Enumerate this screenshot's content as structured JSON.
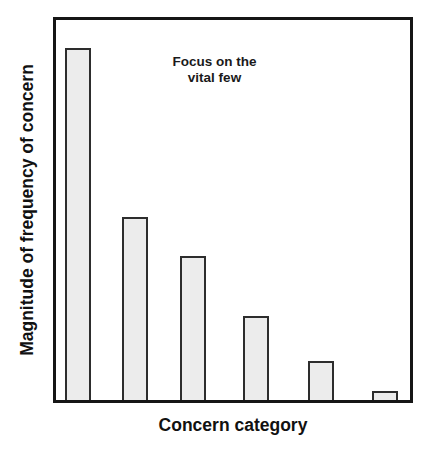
{
  "chart_data": {
    "type": "bar",
    "title": "",
    "xlabel": "Concern category",
    "ylabel": "Magnitude of frequency of concern",
    "annotation": "Focus on the vital few",
    "annotation_lines": [
      "Focus on the",
      "vital few"
    ],
    "categories": [
      "",
      "",
      "",
      "",
      "",
      ""
    ],
    "values": [
      100,
      52,
      41,
      24,
      11,
      2.5
    ],
    "value_note": "relative magnitudes estimated from bar heights; no numeric axis ticks are shown",
    "ylim": [
      0,
      108
    ],
    "grid": false,
    "legend": "none",
    "tick_labels_visible": false,
    "colors": {
      "bar_fill": "#ececec",
      "bar_border": "#2d2d2d",
      "plot_border": "#161616",
      "text": "#1a1a1a"
    }
  }
}
